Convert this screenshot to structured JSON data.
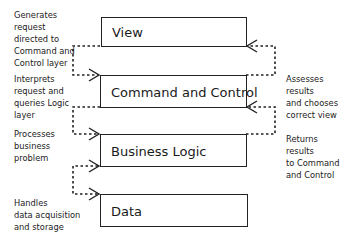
{
  "diagram": {
    "layers": [
      {
        "id": "view",
        "label": "View"
      },
      {
        "id": "command-control",
        "label": "Command and Control"
      },
      {
        "id": "business-logic",
        "label": "Business Logic"
      },
      {
        "id": "data",
        "label": "Data"
      }
    ],
    "left_notes": [
      {
        "text": "Generates\nrequest\ndirected to\nCommand and\nControl layer"
      },
      {
        "text": "Interprets\nrequest and\nqueries Logic\nlayer"
      },
      {
        "text": "Processes\nbusiness\nproblem"
      },
      {
        "text": "Handles\ndata acquisition\nand storage"
      }
    ],
    "right_notes": [
      {
        "text": "Assesses\nresults\nand chooses\ncorrect view"
      },
      {
        "text": "Returns\nresults\nto Command\nand Control"
      }
    ],
    "connectors": [
      {
        "from": "View",
        "to": "Command and Control",
        "side": "left",
        "style": "dashed",
        "arrow": "end"
      },
      {
        "from": "Command and Control",
        "to": "Business Logic",
        "side": "left",
        "style": "dashed",
        "arrow": "end"
      },
      {
        "from": "Business Logic",
        "to": "Data",
        "side": "left",
        "style": "dashed",
        "arrow": "both"
      },
      {
        "from": "Command and Control",
        "to": "View",
        "side": "right",
        "style": "dashed",
        "arrow": "end"
      },
      {
        "from": "Business Logic",
        "to": "Command and Control",
        "side": "right",
        "style": "dashed",
        "arrow": "end"
      }
    ],
    "colors": {
      "stroke": "#222222",
      "background": "#ffffff",
      "text": "#1a1a1a"
    }
  }
}
